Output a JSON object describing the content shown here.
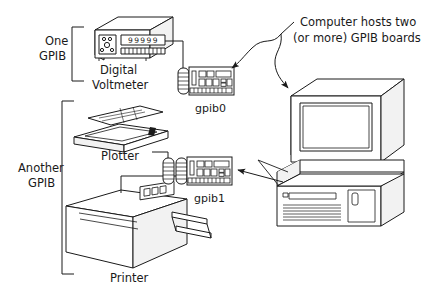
{
  "diagram": {
    "background_color": "#ffffff",
    "line_color": "#1a1a1a",
    "fill_color": "#ffffff",
    "shade_color": "#f2f2f2"
  },
  "brackets": {
    "one_gpib": {
      "line1": "One",
      "line2": "GPIB"
    },
    "another_gpib": {
      "line1": "Another",
      "line2": "GPIB"
    }
  },
  "devices": {
    "voltmeter": {
      "line1": "Digital",
      "line2": "Voltmeter",
      "display_value": "99999"
    },
    "plotter": {
      "label": "Plotter"
    },
    "printer": {
      "label": "Printer"
    }
  },
  "boards": {
    "gpib0": {
      "label": "gpib0",
      "connectors": 1
    },
    "gpib1": {
      "label": "gpib1",
      "connectors": 2
    }
  },
  "computer": {
    "name": "desktop-computer"
  },
  "annotation": {
    "line1": "Computer hosts two",
    "line2": "(or more) GPIB boards"
  }
}
